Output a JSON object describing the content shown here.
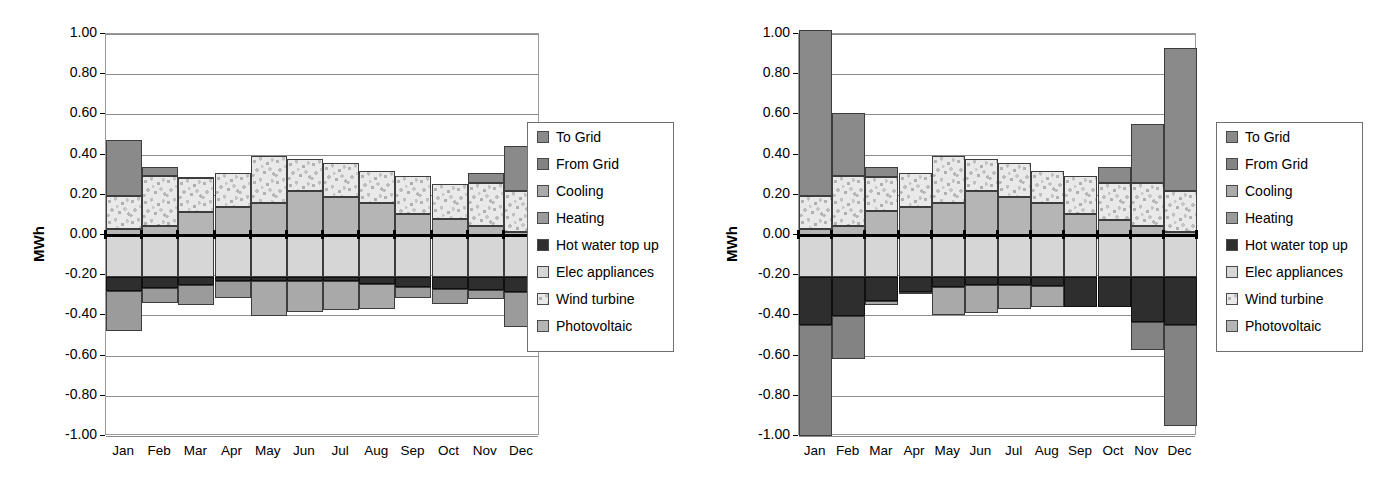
{
  "chart_data": [
    {
      "id": "left",
      "type": "bar",
      "stacked": true,
      "orientation": "vertical",
      "title": "",
      "xlabel": "",
      "ylabel": "MWh",
      "ylim": [
        -1.0,
        1.0
      ],
      "ytick_step": 0.2,
      "ytick_labels": [
        "1.00",
        "0.80",
        "0.60",
        "0.40",
        "0.20",
        "0.00",
        "-0.20",
        "-0.40",
        "-0.60",
        "-0.80",
        "-1.00"
      ],
      "ytick_values": [
        1.0,
        0.8,
        0.6,
        0.4,
        0.2,
        0.0,
        -0.2,
        -0.4,
        -0.6,
        -0.8,
        -1.0
      ],
      "grid": true,
      "legend_position": "right",
      "categories": [
        "Jan",
        "Feb",
        "Mar",
        "Apr",
        "May",
        "Jun",
        "Jul",
        "Aug",
        "Sep",
        "Oct",
        "Nov",
        "Dec"
      ],
      "series": [
        {
          "name": "To Grid",
          "key": "togrid",
          "values": [
            0.28,
            0.045,
            0.005,
            0.0,
            0.0,
            0.0,
            0.0,
            0.0,
            0.0,
            0.0,
            0.05,
            0.225
          ]
        },
        {
          "name": "Wind turbine",
          "key": "wind",
          "values": [
            0.165,
            0.25,
            0.17,
            0.17,
            0.235,
            0.16,
            0.17,
            0.16,
            0.19,
            0.175,
            0.215,
            0.205
          ]
        },
        {
          "name": "Photovoltaic",
          "key": "photovoltaic",
          "values": [
            0.03,
            0.045,
            0.115,
            0.14,
            0.16,
            0.22,
            0.19,
            0.16,
            0.105,
            0.08,
            0.045,
            0.015
          ]
        },
        {
          "name": "Elec appliances",
          "key": "elecapp",
          "values": [
            -0.21,
            -0.21,
            -0.21,
            -0.21,
            -0.21,
            -0.21,
            -0.21,
            -0.21,
            -0.21,
            -0.21,
            -0.21,
            -0.21
          ]
        },
        {
          "name": "Hot water top up",
          "key": "hotwater",
          "values": [
            -0.07,
            -0.055,
            -0.04,
            -0.02,
            -0.02,
            -0.02,
            -0.02,
            -0.035,
            -0.05,
            -0.06,
            -0.065,
            -0.075
          ]
        },
        {
          "name": "Heating",
          "key": "heating",
          "values": [
            -0.2,
            -0.075,
            -0.1,
            -0.085,
            0.0,
            0.0,
            0.0,
            0.0,
            -0.055,
            -0.075,
            -0.045,
            -0.175
          ]
        },
        {
          "name": "Cooling",
          "key": "cooling",
          "values": [
            0.0,
            0.0,
            0.0,
            0.0,
            -0.175,
            -0.155,
            -0.145,
            -0.125,
            0.0,
            0.0,
            0.0,
            0.0
          ]
        },
        {
          "name": "From Grid",
          "key": "fromgrid",
          "values": [
            0.0,
            0.0,
            0.0,
            0.0,
            0.0,
            0.0,
            0.0,
            0.0,
            0.0,
            0.0,
            0.0,
            0.0
          ]
        }
      ],
      "positive_stack_order": [
        "photovoltaic",
        "wind",
        "togrid"
      ],
      "negative_stack_order": [
        "elecapp",
        "hotwater",
        "cooling",
        "heating",
        "fromgrid"
      ],
      "legend": [
        {
          "label": "To Grid",
          "key": "togrid"
        },
        {
          "label": "From Grid",
          "key": "fromgrid"
        },
        {
          "label": "Cooling",
          "key": "cooling"
        },
        {
          "label": "Heating",
          "key": "heating"
        },
        {
          "label": "Hot water top up",
          "key": "hotwater"
        },
        {
          "label": "Elec appliances",
          "key": "elecapp"
        },
        {
          "label": "Wind turbine",
          "key": "wind"
        },
        {
          "label": "Photovoltaic",
          "key": "photovoltaic"
        }
      ]
    },
    {
      "id": "right",
      "type": "bar",
      "stacked": true,
      "orientation": "vertical",
      "title": "",
      "xlabel": "",
      "ylabel": "MWh",
      "ylim": [
        -1.0,
        1.0
      ],
      "ytick_step": 0.2,
      "ytick_labels": [
        "1.00",
        "0.80",
        "0.60",
        "0.40",
        "0.20",
        "0.00",
        "-0.20",
        "-0.40",
        "-0.60",
        "-0.80",
        "-1.00"
      ],
      "ytick_values": [
        1.0,
        0.8,
        0.6,
        0.4,
        0.2,
        0.0,
        -0.2,
        -0.4,
        -0.6,
        -0.8,
        -1.0
      ],
      "grid": true,
      "legend_position": "right",
      "categories": [
        "Jan",
        "Feb",
        "Mar",
        "Apr",
        "May",
        "Jun",
        "Jul",
        "Aug",
        "Sep",
        "Oct",
        "Nov",
        "Dec"
      ],
      "series": [
        {
          "name": "To Grid",
          "key": "togrid",
          "values": [
            0.825,
            0.31,
            0.05,
            0.0,
            0.0,
            0.0,
            0.0,
            0.0,
            0.0,
            0.08,
            0.29,
            0.71
          ]
        },
        {
          "name": "Wind turbine",
          "key": "wind",
          "values": [
            0.165,
            0.25,
            0.17,
            0.17,
            0.235,
            0.16,
            0.17,
            0.16,
            0.19,
            0.185,
            0.215,
            0.205
          ]
        },
        {
          "name": "Photovoltaic",
          "key": "photovoltaic",
          "values": [
            0.03,
            0.045,
            0.12,
            0.14,
            0.16,
            0.22,
            0.19,
            0.16,
            0.105,
            0.075,
            0.045,
            0.015
          ]
        },
        {
          "name": "Elec appliances",
          "key": "elecapp",
          "values": [
            -0.21,
            -0.21,
            -0.21,
            -0.21,
            -0.21,
            -0.21,
            -0.21,
            -0.21,
            -0.21,
            -0.21,
            -0.21,
            -0.21
          ]
        },
        {
          "name": "Hot water top up",
          "key": "hotwater",
          "values": [
            -0.24,
            -0.195,
            -0.12,
            -0.075,
            -0.05,
            -0.04,
            -0.04,
            -0.045,
            -0.15,
            -0.15,
            -0.225,
            -0.24
          ]
        },
        {
          "name": "Cooling",
          "key": "cooling",
          "values": [
            0.0,
            0.0,
            -0.02,
            -0.005,
            -0.14,
            -0.14,
            -0.12,
            -0.105,
            0.0,
            0.0,
            0.0,
            0.0
          ]
        },
        {
          "name": "Heating",
          "key": "heating",
          "values": [
            0.0,
            0.0,
            0.0,
            0.0,
            0.0,
            0.0,
            0.0,
            0.0,
            0.0,
            0.0,
            0.0,
            0.0
          ]
        },
        {
          "name": "From Grid",
          "key": "fromgrid",
          "values": [
            -0.55,
            -0.21,
            0.0,
            0.0,
            0.0,
            0.0,
            0.0,
            0.0,
            0.0,
            0.0,
            -0.135,
            -0.5
          ]
        }
      ],
      "positive_stack_order": [
        "photovoltaic",
        "wind",
        "togrid"
      ],
      "negative_stack_order": [
        "elecapp",
        "hotwater",
        "cooling",
        "heating",
        "fromgrid"
      ],
      "legend": [
        {
          "label": "To Grid",
          "key": "togrid"
        },
        {
          "label": "From Grid",
          "key": "fromgrid"
        },
        {
          "label": "Cooling",
          "key": "cooling"
        },
        {
          "label": "Heating",
          "key": "heating"
        },
        {
          "label": "Hot water top up",
          "key": "hotwater"
        },
        {
          "label": "Elec appliances",
          "key": "elecapp"
        },
        {
          "label": "Wind turbine",
          "key": "wind"
        },
        {
          "label": "Photovoltaic",
          "key": "photovoltaic"
        }
      ]
    }
  ],
  "colors": {
    "togrid": "#8a8a8a",
    "fromgrid": "#838383",
    "cooling": "#a9a9a9",
    "heating": "#9b9b9b",
    "hotwater": "#2e2e2e",
    "elecapp": "#d6d6d6",
    "wind": "#e9e9e9",
    "photovoltaic": "#b5b5b5",
    "gridline": "#8c8c8c",
    "axis": "#000000",
    "background": "#ffffff"
  }
}
